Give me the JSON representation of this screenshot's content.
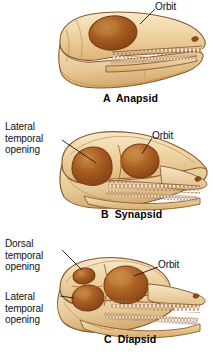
{
  "figure": {
    "background_color": "#ffffff",
    "colors": {
      "bone_light": "#f2dcb4",
      "bone_mid": "#e8c48d",
      "bone_shadow": "#d4a463",
      "outline": "#8a5a2b",
      "opening_dark": "#8a4a1e",
      "opening_mid": "#b5651d",
      "opening_light": "#c98a45",
      "tooth": "#f6e6c8",
      "tooth_outline": "#7a3f1d",
      "leader_line": "#1a1a1a",
      "text": "#111111"
    }
  },
  "panels": [
    {
      "id": "A",
      "caption": "A  Anapsid",
      "labels": [
        {
          "name": "orbit",
          "text": "Orbit"
        }
      ]
    },
    {
      "id": "B",
      "caption": "B  Synapsid",
      "labels": [
        {
          "name": "lateral-temporal-opening",
          "text": "Lateral\ntemporal\nopening"
        },
        {
          "name": "orbit",
          "text": "Orbit"
        }
      ]
    },
    {
      "id": "C",
      "caption": "C  Diapsid",
      "labels": [
        {
          "name": "dorsal-temporal-opening",
          "text": "Dorsal\ntemporal\nopening"
        },
        {
          "name": "lateral-temporal-opening",
          "text": "Lateral\ntemporal\nopening"
        },
        {
          "name": "orbit",
          "text": "Orbit"
        }
      ]
    }
  ],
  "text": {
    "a_orbit": "Orbit",
    "a_caption": "A  Anapsid",
    "b_lateral": "Lateral\ntemporal\nopening",
    "b_orbit": "Orbit",
    "b_caption": "B  Synapsid",
    "c_dorsal": "Dorsal\ntemporal\nopening",
    "c_lateral": "Lateral\ntemporal\nopening",
    "c_orbit": "Orbit",
    "c_caption": "C  Diapsid"
  }
}
